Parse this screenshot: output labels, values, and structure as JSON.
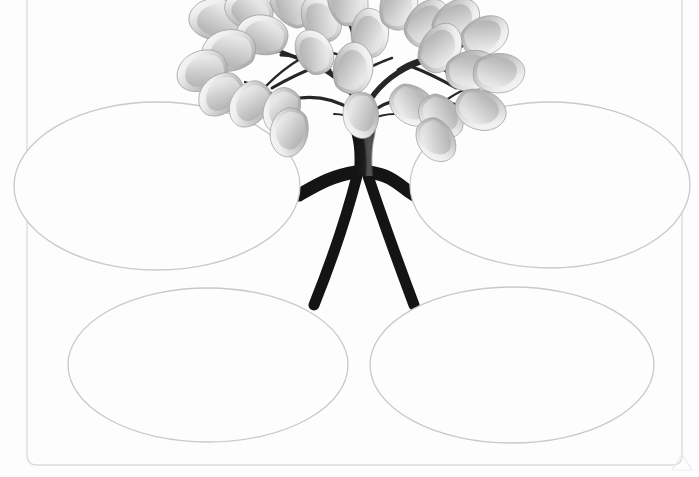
{
  "page": {
    "kind": "graphic-organizer-worksheet",
    "title": "",
    "background_color": "#fdfdfd",
    "width": 699,
    "height": 477
  },
  "border": {
    "name": "page-border",
    "stroke_color": "#d8d8d8",
    "stroke_width": 1.4,
    "corner_radius": 10,
    "left": 27,
    "top": -14,
    "right": 682,
    "bottom": 465
  },
  "tree": {
    "name": "tree-illustration",
    "trunk_color": "#1a1a1a",
    "branch_color": "#262626",
    "leaf_fill_light": "#f2f2f2",
    "leaf_fill_mid": "#bdbdbd",
    "leaf_fill_dark": "#8a8a8a",
    "leaf_outline": "#9a9a9a",
    "leaf_count": 26,
    "root_count": 4,
    "trunk_center_x": 362,
    "canopy_top_y": 8
  },
  "ovals": [
    {
      "id": "oval-top-left",
      "name": "oval-top-left",
      "position": "top-left",
      "label": "",
      "cx": 157,
      "cy": 186,
      "rx": 143,
      "ry": 84,
      "stroke_color": "#c9c9c9",
      "fill_color": "#fdfdfd"
    },
    {
      "id": "oval-top-right",
      "name": "oval-top-right",
      "position": "top-right",
      "label": "",
      "cx": 550,
      "cy": 185,
      "rx": 140,
      "ry": 83,
      "stroke_color": "#c9c9c9",
      "fill_color": "#fdfdfd"
    },
    {
      "id": "oval-bottom-left",
      "name": "oval-bottom-left",
      "position": "bottom-left",
      "label": "",
      "cx": 208,
      "cy": 365,
      "rx": 140,
      "ry": 77,
      "stroke_color": "#c9c9c9",
      "fill_color": "#fdfdfd"
    },
    {
      "id": "oval-bottom-right",
      "name": "oval-bottom-right",
      "position": "bottom-right",
      "label": "",
      "cx": 512,
      "cy": 365,
      "rx": 142,
      "ry": 78,
      "stroke_color": "#c9c9c9",
      "fill_color": "#fdfdfd"
    }
  ],
  "corner_mark": {
    "name": "corner-triangle-mark",
    "visible": true,
    "color": "#ececec"
  }
}
